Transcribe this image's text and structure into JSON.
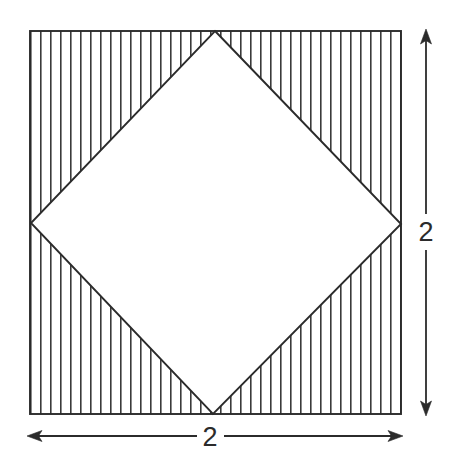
{
  "figure": {
    "background_color": "#ffffff",
    "stroke_color": "#2b2b2b",
    "hatch_color": "#3a3a3a",
    "outer_square": {
      "name": "outer-square",
      "left": 30,
      "top": 31,
      "right": 401,
      "bottom": 414,
      "side_label": "2"
    },
    "inner_diamond": {
      "name": "inner-diamond",
      "vertices": {
        "top": [
          215,
          31
        ],
        "right": [
          401,
          224
        ],
        "bottom": [
          213,
          414
        ],
        "left": [
          31,
          223
        ]
      },
      "fill": "#ffffff"
    },
    "hatching": {
      "pattern": "vertical-lines",
      "spacing_px": 10,
      "line_width_px": 1.6,
      "region": "between-outer-square-and-inner-diamond"
    },
    "dimensions": {
      "vertical": {
        "label": "2",
        "axis_x": 426,
        "from_y": 31,
        "to_y": 414,
        "label_x": 426,
        "label_y": 232,
        "arrow_both_ends": true
      },
      "horizontal": {
        "label": "2",
        "axis_y": 436,
        "from_x": 28,
        "to_x": 402,
        "label_x": 210,
        "label_y": 446,
        "arrow_both_ends": true
      }
    }
  }
}
